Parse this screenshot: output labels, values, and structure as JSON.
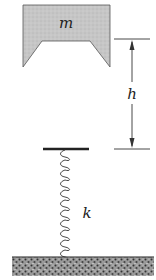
{
  "diagram": {
    "type": "physics-mass-spring",
    "mass": {
      "label": "m",
      "fill": "#c8c8c8"
    },
    "height": {
      "label": "h"
    },
    "spring": {
      "label": "k",
      "coils": 12
    },
    "colors": {
      "ink": "#222222",
      "ground": "#555555",
      "block": "#c8c8c8"
    }
  }
}
